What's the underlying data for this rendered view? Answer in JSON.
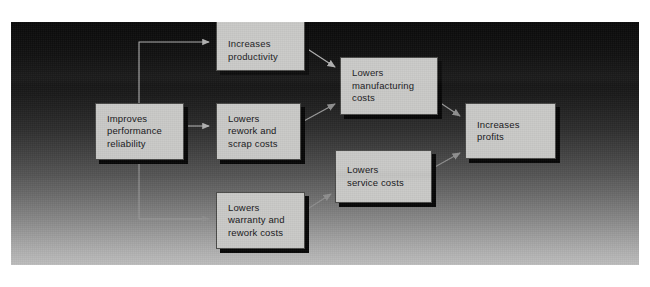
{
  "figure": {
    "type": "flow-diagram",
    "title": "",
    "background_top_color": "#0a0a0a",
    "background_bottom_color": "#bdbdbd",
    "node_fill_color": "#c9c9c7",
    "node_shadow_color": "#060606",
    "connector_color": "#9a9a9a",
    "text_color": "#17171a"
  },
  "nodes": [
    {
      "id": "improves-performance-reliability",
      "label": "Improves\nperformance\nreliability",
      "x": 84,
      "y": 81,
      "w": 89,
      "h": 57
    },
    {
      "id": "increases-productivity",
      "label": "Increases\nproductivity",
      "x": 205,
      "y": -8,
      "w": 89,
      "h": 57
    },
    {
      "id": "lowers-rework-and-scrap-costs",
      "label": "Lowers\nrework and\nscrap costs",
      "x": 205,
      "y": 81,
      "w": 85,
      "h": 57
    },
    {
      "id": "lowers-warranty-and-rework-costs",
      "label": "Lowers\nwarranty and\nrework costs",
      "x": 205,
      "y": 170,
      "w": 89,
      "h": 57
    },
    {
      "id": "lowers-manufacturing-costs",
      "label": "Lowers\nmanufacturing\ncosts",
      "x": 329,
      "y": 35,
      "w": 98,
      "h": 58
    },
    {
      "id": "lowers-service-costs",
      "label": "Lowers\nservice costs",
      "x": 324,
      "y": 128,
      "w": 97,
      "h": 53
    },
    {
      "id": "increases-profits",
      "label": "Increases\nprofits",
      "x": 454,
      "y": 81,
      "w": 91,
      "h": 56
    }
  ],
  "connectors": [
    {
      "id": "reliability-to-productivity",
      "from": "improves-performance-reliability",
      "to": "increases-productivity",
      "style": "orthogonal-up"
    },
    {
      "id": "reliability-to-rework-scrap",
      "from": "improves-performance-reliability",
      "to": "lowers-rework-and-scrap-costs",
      "style": "straight-right"
    },
    {
      "id": "reliability-to-warranty-rework",
      "from": "improves-performance-reliability",
      "to": "lowers-warranty-and-rework-costs",
      "style": "orthogonal-down"
    },
    {
      "id": "productivity-to-manufacturing",
      "from": "increases-productivity",
      "to": "lowers-manufacturing-costs",
      "style": "diagonal-down-right"
    },
    {
      "id": "rework-scrap-to-manufacturing",
      "from": "lowers-rework-and-scrap-costs",
      "to": "lowers-manufacturing-costs",
      "style": "diagonal-up-right"
    },
    {
      "id": "warranty-rework-to-service",
      "from": "lowers-warranty-and-rework-costs",
      "to": "lowers-service-costs",
      "style": "diagonal-up-right"
    },
    {
      "id": "manufacturing-to-profits",
      "from": "lowers-manufacturing-costs",
      "to": "increases-profits",
      "style": "diagonal-down-right"
    },
    {
      "id": "service-to-profits",
      "from": "lowers-service-costs",
      "to": "increases-profits",
      "style": "diagonal-up-right"
    }
  ]
}
